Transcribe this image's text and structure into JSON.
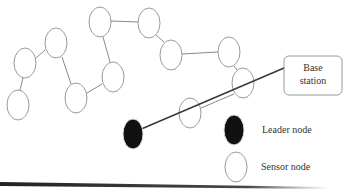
{
  "diagram": {
    "base_station": {
      "line1": "Base",
      "line2": "station"
    },
    "legend": {
      "leader_label": "Leader node",
      "sensor_label": "Sensor node"
    },
    "colors": {
      "node_stroke": "#9a9a9a",
      "edge": "#8a8a8a",
      "leader_fill": "#111111",
      "route_line": "#3a3a3a",
      "box_stroke": "#9a9a9a",
      "baseline": "#333333"
    },
    "nodes": [
      {
        "id": "n1",
        "cx": 18,
        "cy": 105
      },
      {
        "id": "n2",
        "cx": 25,
        "cy": 63
      },
      {
        "id": "n3",
        "cx": 56,
        "cy": 43
      },
      {
        "id": "n4",
        "cx": 100,
        "cy": 22
      },
      {
        "id": "n5",
        "cx": 149,
        "cy": 23
      },
      {
        "id": "n6",
        "cx": 171,
        "cy": 55
      },
      {
        "id": "n7",
        "cx": 229,
        "cy": 52
      },
      {
        "id": "n8",
        "cx": 243,
        "cy": 83
      },
      {
        "id": "n9",
        "cx": 113,
        "cy": 77
      },
      {
        "id": "n10",
        "cx": 76,
        "cy": 98
      },
      {
        "id": "n11",
        "cx": 190,
        "cy": 113
      }
    ],
    "leader": {
      "cx": 133,
      "cy": 134
    },
    "edges": [
      [
        "n1",
        "n2"
      ],
      [
        "n2",
        "n3"
      ],
      [
        "n3",
        "n10"
      ],
      [
        "n10",
        "n9"
      ],
      [
        "n9",
        "n4"
      ],
      [
        "n4",
        "n5"
      ],
      [
        "n5",
        "n6"
      ],
      [
        "n6",
        "n7"
      ],
      [
        "n7",
        "n8"
      ],
      [
        "n8",
        "n11"
      ]
    ]
  }
}
